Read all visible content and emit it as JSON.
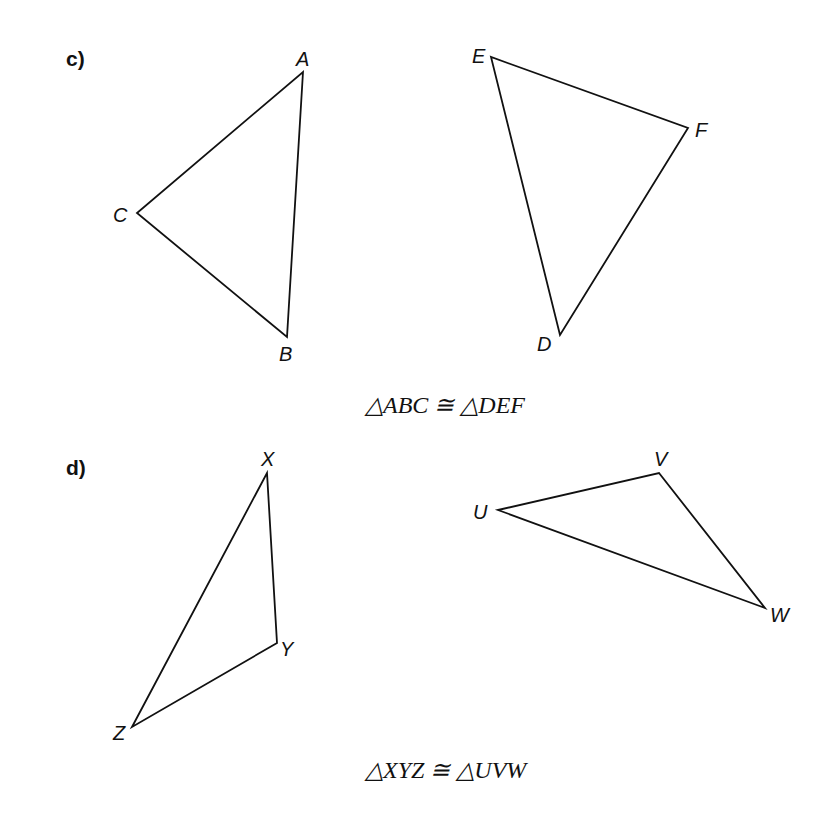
{
  "parts": [
    {
      "id": "c",
      "label": "c)",
      "statement": "△ABC ≅ △DEF",
      "triangles": [
        {
          "name": "ABC",
          "vertices": [
            {
              "name": "A",
              "x": 303,
              "y": 72
            },
            {
              "name": "B",
              "x": 287,
              "y": 337
            },
            {
              "name": "C",
              "x": 137,
              "y": 213
            }
          ]
        },
        {
          "name": "DEF",
          "vertices": [
            {
              "name": "D",
              "x": 560,
              "y": 335
            },
            {
              "name": "E",
              "x": 491,
              "y": 57
            },
            {
              "name": "F",
              "x": 688,
              "y": 128
            }
          ]
        }
      ]
    },
    {
      "id": "d",
      "label": "d)",
      "statement": "△XYZ ≅ △UVW",
      "triangles": [
        {
          "name": "XYZ",
          "vertices": [
            {
              "name": "X",
              "x": 267,
              "y": 473
            },
            {
              "name": "Y",
              "x": 277,
              "y": 643
            },
            {
              "name": "Z",
              "x": 132,
              "y": 727
            }
          ]
        },
        {
          "name": "UVW",
          "vertices": [
            {
              "name": "U",
              "x": 498,
              "y": 510
            },
            {
              "name": "V",
              "x": 659,
              "y": 473
            },
            {
              "name": "W",
              "x": 765,
              "y": 608
            }
          ]
        }
      ]
    }
  ]
}
